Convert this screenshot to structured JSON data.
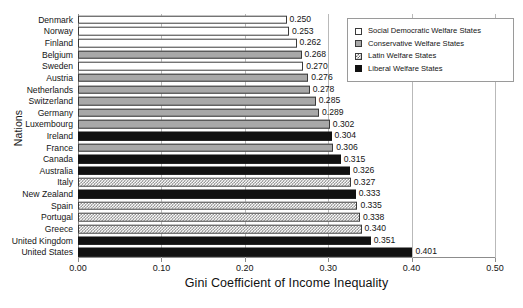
{
  "chart_data": {
    "type": "bar",
    "orientation": "horizontal",
    "title": "",
    "xlabel": "Gini Coefficient of Income Inequality",
    "ylabel": "Nations",
    "xlim": [
      0.0,
      0.5
    ],
    "xticks": [
      "0.00",
      "0.10",
      "0.20",
      "0.30",
      "0.40",
      "0.50"
    ],
    "xtick_values": [
      0.0,
      0.1,
      0.2,
      0.3,
      0.4,
      0.5
    ],
    "grid": "vertical",
    "legend_position": "top-right",
    "categories": [
      "Denmark",
      "Norway",
      "Finland",
      "Belgium",
      "Sweden",
      "Austria",
      "Netherlands",
      "Switzerland",
      "Germany",
      "Luxembourg",
      "Ireland",
      "France",
      "Canada",
      "Australia",
      "Italy",
      "New Zealand",
      "Spain",
      "Portugal",
      "Greece",
      "United Kingdom",
      "United States"
    ],
    "values": [
      0.25,
      0.253,
      0.262,
      0.268,
      0.27,
      0.276,
      0.278,
      0.285,
      0.289,
      0.302,
      0.304,
      0.306,
      0.315,
      0.326,
      0.327,
      0.333,
      0.335,
      0.338,
      0.34,
      0.351,
      0.401
    ],
    "value_labels": [
      "0.250",
      "0.253",
      "0.262",
      "0.268",
      "0.270",
      "0.276",
      "0.278",
      "0.285",
      "0.289",
      "0.302",
      "0.304",
      "0.306",
      "0.315",
      "0.326",
      "0.327",
      "0.333",
      "0.335",
      "0.338",
      "0.340",
      "0.351",
      "0.401"
    ],
    "groups": [
      "social-democratic",
      "social-democratic",
      "social-democratic",
      "conservative",
      "social-democratic",
      "conservative",
      "conservative",
      "conservative",
      "conservative",
      "conservative",
      "liberal",
      "conservative",
      "liberal",
      "liberal",
      "latin",
      "liberal",
      "latin",
      "latin",
      "latin",
      "liberal",
      "liberal"
    ],
    "series": [
      {
        "name": "Social Democratic Welfare States",
        "key": "social-democratic",
        "fill": "f-white",
        "members": [
          "Denmark",
          "Norway",
          "Finland",
          "Sweden"
        ]
      },
      {
        "name": "Conservative Welfare States",
        "key": "conservative",
        "fill": "f-gray",
        "members": [
          "Belgium",
          "Austria",
          "Netherlands",
          "Switzerland",
          "Germany",
          "Luxembourg",
          "France"
        ]
      },
      {
        "name": "Latin Welfare States",
        "key": "latin",
        "fill": "f-latin",
        "members": [
          "Italy",
          "Spain",
          "Portugal",
          "Greece"
        ]
      },
      {
        "name": "Liberal Welfare States",
        "key": "liberal",
        "fill": "f-black",
        "members": [
          "Ireland",
          "Canada",
          "Australia",
          "New Zealand",
          "United Kingdom",
          "United States"
        ]
      }
    ]
  },
  "legend": {
    "items": [
      {
        "label": "Social Democratic Welfare States",
        "fill": "f-white"
      },
      {
        "label": "Conservative Welfare States",
        "fill": "f-gray"
      },
      {
        "label": "Latin Welfare States",
        "fill": "f-latin"
      },
      {
        "label": "Liberal Welfare States",
        "fill": "f-black"
      }
    ]
  },
  "colors": {
    "social_democratic": "#ffffff",
    "conservative": "#a8a8a8",
    "latin": "#7d7d7d",
    "liberal": "#111111",
    "axis": "#8c8c8c",
    "gridline": "#b9b9b9",
    "text": "#141414"
  }
}
